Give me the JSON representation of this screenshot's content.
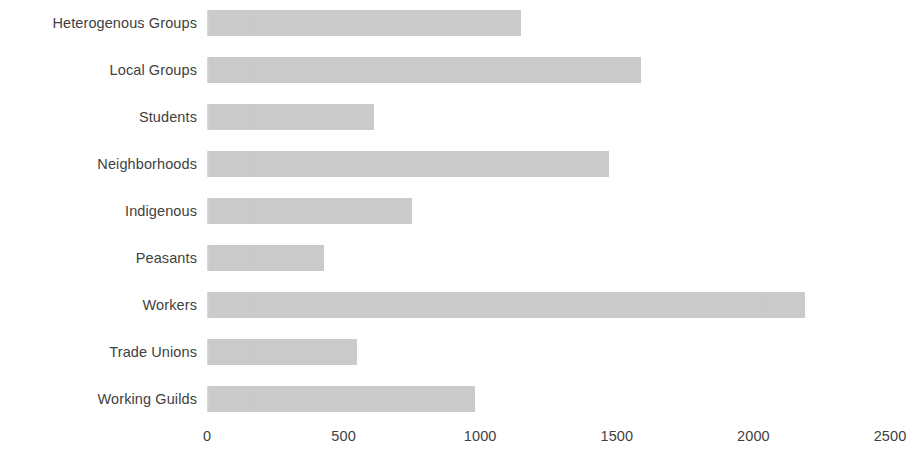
{
  "chart_data": {
    "type": "bar",
    "orientation": "horizontal",
    "title": "",
    "subtitle": "",
    "xlabel": "",
    "ylabel": "",
    "grid": false,
    "legend": false,
    "legend_position": "none",
    "bar_color": "#d4d4d4",
    "text_color": "#3f3f3f",
    "background_color": "#ffffff",
    "xlim": [
      0,
      2500
    ],
    "xticks": [
      0,
      500,
      1000,
      1500,
      2000,
      2500
    ],
    "xtick_labels": [
      "0",
      "500",
      "1000",
      "1500",
      "2000",
      "2500"
    ],
    "categories": [
      "Heterogenous Groups",
      "Local Groups",
      "Students",
      "Neighborhoods",
      "Indigenous",
      "Peasants",
      "Workers",
      "Trade Unions",
      "Working Guilds"
    ],
    "values": [
      1150,
      1590,
      610,
      1470,
      750,
      430,
      2190,
      550,
      980
    ],
    "bars": [
      {
        "label": "Heterogenous Groups",
        "value": 1150
      },
      {
        "label": "Local Groups",
        "value": 1590
      },
      {
        "label": "Students",
        "value": 610
      },
      {
        "label": "Neighborhoods",
        "value": 1470
      },
      {
        "label": "Indigenous",
        "value": 750
      },
      {
        "label": "Peasants",
        "value": 430
      },
      {
        "label": "Workers",
        "value": 2190
      },
      {
        "label": "Trade Unions",
        "value": 550
      },
      {
        "label": "Working Guilds",
        "value": 980
      }
    ]
  }
}
